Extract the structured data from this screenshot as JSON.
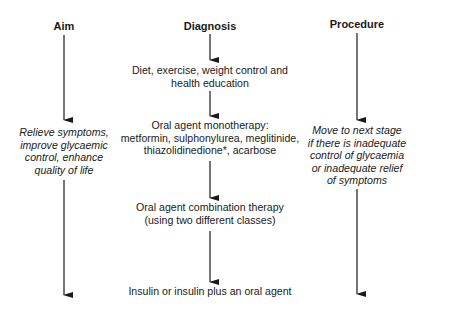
{
  "columns": {
    "aim": {
      "header": "Aim",
      "text_lines": [
        "Relieve symptoms,",
        "improve glycaemic",
        "control, enhance",
        "quality of life"
      ]
    },
    "diagnosis": {
      "header": "Diagnosis",
      "steps": [
        {
          "lines": [
            "Diet, exercise, weight control and",
            "health education"
          ]
        },
        {
          "lines": [
            "Oral agent monotherapy:",
            "metformin, sulphonylurea, meglitinide,",
            "thiazolidinedione*, acarbose"
          ]
        },
        {
          "lines": [
            "Oral agent combination therapy",
            "(using two different classes)"
          ]
        },
        {
          "lines": [
            "Insulin or insulin plus an oral agent"
          ]
        }
      ]
    },
    "procedure": {
      "header": "Procedure",
      "text_lines": [
        "Move to next stage",
        "if there is inadequate",
        "control of glycaemia",
        "or inadequate relief",
        "of symptoms"
      ]
    }
  },
  "colors": {
    "ink": "#1a1a1a",
    "background": "#ffffff"
  }
}
